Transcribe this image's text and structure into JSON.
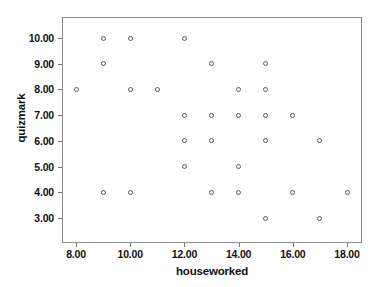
{
  "chart_data": {
    "type": "scatter",
    "title": "",
    "xlabel": "houseworked",
    "ylabel": "quizmark",
    "xlim": [
      7.0,
      19.0
    ],
    "ylim": [
      2.3,
      10.9
    ],
    "grid": false,
    "legend": null,
    "marker": "open-circle",
    "marker_color": "#5a5a5a",
    "xticks": [
      8,
      10,
      12,
      14,
      16,
      18
    ],
    "xtick_labels": [
      "8.00",
      "10.00",
      "12.00",
      "14.00",
      "16.00",
      "18.00"
    ],
    "yticks": [
      3,
      4,
      5,
      6,
      7,
      8,
      9,
      10
    ],
    "ytick_labels": [
      "3.00",
      "4.00",
      "5.00",
      "6.00",
      "7.00",
      "8.00",
      "9.00",
      "10.00"
    ],
    "x": [
      9,
      10,
      12,
      9,
      13,
      15,
      8,
      10,
      11,
      14,
      15,
      12,
      13,
      14,
      15,
      16,
      12,
      13,
      15,
      17,
      12,
      14,
      9,
      10,
      13,
      14,
      16,
      18,
      15,
      17
    ],
    "y": [
      10,
      10,
      10,
      9,
      9,
      9,
      8,
      8,
      8,
      8,
      8,
      7,
      7,
      7,
      7,
      7,
      6,
      6,
      6,
      6,
      5,
      5,
      4,
      4,
      4,
      4,
      4,
      4,
      3,
      3
    ],
    "points": [
      {
        "x": 9,
        "y": 10
      },
      {
        "x": 10,
        "y": 10
      },
      {
        "x": 12,
        "y": 10
      },
      {
        "x": 9,
        "y": 9
      },
      {
        "x": 13,
        "y": 9
      },
      {
        "x": 15,
        "y": 9
      },
      {
        "x": 8,
        "y": 8
      },
      {
        "x": 10,
        "y": 8
      },
      {
        "x": 11,
        "y": 8
      },
      {
        "x": 14,
        "y": 8
      },
      {
        "x": 15,
        "y": 8
      },
      {
        "x": 12,
        "y": 7
      },
      {
        "x": 13,
        "y": 7
      },
      {
        "x": 14,
        "y": 7
      },
      {
        "x": 15,
        "y": 7
      },
      {
        "x": 16,
        "y": 7
      },
      {
        "x": 12,
        "y": 6
      },
      {
        "x": 13,
        "y": 6
      },
      {
        "x": 15,
        "y": 6
      },
      {
        "x": 17,
        "y": 6
      },
      {
        "x": 12,
        "y": 5
      },
      {
        "x": 14,
        "y": 5
      },
      {
        "x": 9,
        "y": 4
      },
      {
        "x": 10,
        "y": 4
      },
      {
        "x": 13,
        "y": 4
      },
      {
        "x": 14,
        "y": 4
      },
      {
        "x": 16,
        "y": 4
      },
      {
        "x": 18,
        "y": 4
      },
      {
        "x": 15,
        "y": 3
      },
      {
        "x": 17,
        "y": 3
      }
    ]
  },
  "axes": {
    "x_title": "houseworked",
    "y_title": "quizmark"
  }
}
